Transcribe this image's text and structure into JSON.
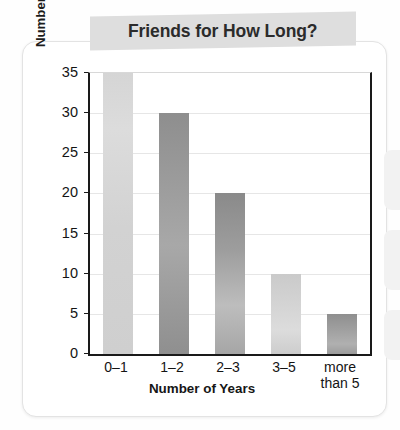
{
  "page": {
    "title_banner": "Friends for How Long?"
  },
  "chart_data": {
    "type": "bar",
    "title": "Friends for How Long?",
    "xlabel": "Number of Years",
    "ylabel": "Number of Students out of 100",
    "categories": [
      "0–1",
      "1–2",
      "2–3",
      "3–5",
      "more\nthan 5"
    ],
    "category_lines": [
      [
        "0–1"
      ],
      [
        "1–2"
      ],
      [
        "2–3"
      ],
      [
        "3–5"
      ],
      [
        "more",
        "than 5"
      ]
    ],
    "values": [
      35,
      30,
      20,
      10,
      5
    ],
    "ylim": [
      0,
      35
    ],
    "ytick_values": [
      0,
      5,
      10,
      15,
      20,
      25,
      30,
      35
    ],
    "ytick_labels": [
      "0",
      "5",
      "10",
      "15",
      "20",
      "25",
      "30",
      "35"
    ],
    "grid": true,
    "legend": null,
    "bar_colors": [
      "#d5d5d5",
      "#9a9a9a",
      "#a0a0a0",
      "#d3d3d3",
      "#a0a0a0"
    ]
  },
  "colors": {
    "banner_bg": "#dedede",
    "axis": "#1a1a1a",
    "gridline": "#e6e6e6",
    "text": "#141414",
    "card_bg": "#ffffff"
  }
}
